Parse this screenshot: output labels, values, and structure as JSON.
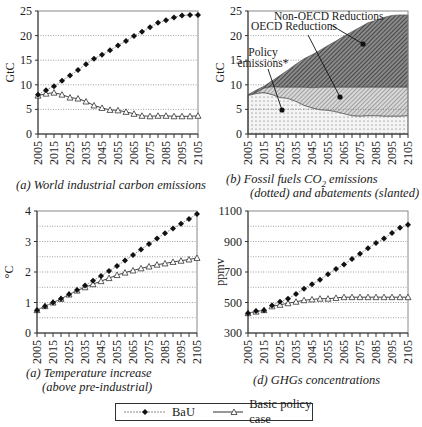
{
  "years": [
    "2005",
    "2015",
    "2025",
    "2035",
    "2045",
    "2055",
    "2065",
    "2075",
    "2085",
    "2095",
    "2105"
  ],
  "legend": {
    "bau_label": "BaU",
    "policy_label": "Basic policy case"
  },
  "panels": {
    "a": {
      "caption": "(a) World industrial carbon emissions",
      "ylabel": "GtC",
      "yticks": [
        "0",
        "5",
        "10",
        "15",
        "20",
        "25"
      ]
    },
    "b": {
      "caption_line1_prefix": "(b)  Fossil fuels CO",
      "caption_line1_sub": "2",
      "caption_line1_suffix": " emissions",
      "caption_line2": "(dotted) and abatements (slanted)",
      "ylabel": "GtC",
      "yticks": [
        "0",
        "5",
        "10",
        "15",
        "20",
        "25"
      ],
      "annotations": {
        "non_oecd": "Non-OECD Reductions",
        "oecd": "OECD Reductions",
        "policy_line1": "Policy",
        "policy_line2": "emissions*"
      }
    },
    "c": {
      "caption_line1": "(a)  Temperature increase",
      "caption_line2": "(above pre-industrial)",
      "ylabel": "°C",
      "yticks": [
        "0",
        "1",
        "2",
        "3",
        "4"
      ]
    },
    "d": {
      "caption": "(d) GHGs concentrations",
      "ylabel": "ppmv",
      "yticks": [
        "300",
        "500",
        "700",
        "900",
        "1100"
      ]
    }
  },
  "chart_data": [
    {
      "type": "line",
      "title": "(a) World industrial carbon emissions",
      "xlabel": "",
      "ylabel": "GtC",
      "ylim": [
        0,
        25
      ],
      "grid": "horizontal dotted every 5",
      "x": [
        2005,
        2010,
        2015,
        2020,
        2025,
        2030,
        2035,
        2040,
        2045,
        2050,
        2055,
        2060,
        2065,
        2070,
        2075,
        2080,
        2085,
        2090,
        2095,
        2100,
        2105
      ],
      "series": [
        {
          "name": "BaU",
          "marker": "filled-diamond",
          "values": [
            8.0,
            8.9,
            9.7,
            10.8,
            11.9,
            13.0,
            14.2,
            15.3,
            16.1,
            17.0,
            18.0,
            18.9,
            19.9,
            20.8,
            21.7,
            22.6,
            23.1,
            23.7,
            24.1,
            24.2,
            24.2
          ]
        },
        {
          "name": "Basic policy case",
          "marker": "open-triangle",
          "values": [
            7.8,
            8.2,
            8.4,
            8.0,
            7.4,
            7.2,
            6.6,
            5.8,
            5.3,
            4.9,
            4.8,
            4.5,
            4.1,
            3.7,
            3.6,
            3.7,
            3.7,
            3.6,
            3.6,
            3.6,
            3.7
          ]
        }
      ]
    },
    {
      "type": "area",
      "title": "(b) Fossil fuels CO2 emissions (dotted) and abatements (slanted)",
      "xlabel": "",
      "ylabel": "GtC",
      "ylim": [
        0,
        25
      ],
      "grid": "horizontal dotted every 5",
      "x": [
        2005,
        2010,
        2015,
        2020,
        2025,
        2030,
        2035,
        2040,
        2045,
        2050,
        2055,
        2060,
        2065,
        2070,
        2075,
        2080,
        2085,
        2090,
        2095,
        2100,
        2105
      ],
      "series": [
        {
          "name": "Policy emissions*",
          "pattern": "dotted",
          "values": [
            7.8,
            8.2,
            8.4,
            8.0,
            7.4,
            7.2,
            6.6,
            5.8,
            5.3,
            4.9,
            4.8,
            4.5,
            4.1,
            3.7,
            3.6,
            3.7,
            3.7,
            3.6,
            3.6,
            3.6,
            3.7
          ]
        },
        {
          "name": "OECD Reductions (top boundary)",
          "pattern": "light-slanted",
          "values": [
            7.8,
            8.4,
            9.3,
            9.6,
            9.5,
            9.5,
            9.5,
            9.5,
            9.4,
            9.5,
            9.5,
            9.5,
            9.5,
            9.5,
            9.5,
            9.5,
            9.5,
            9.5,
            9.5,
            9.5,
            9.5
          ]
        },
        {
          "name": "Non-OECD Reductions (top boundary = BaU)",
          "pattern": "dark-slanted",
          "values": [
            8.0,
            8.9,
            9.7,
            10.8,
            11.9,
            13.0,
            14.2,
            15.3,
            16.1,
            17.0,
            18.0,
            18.9,
            19.9,
            20.8,
            21.7,
            22.6,
            23.1,
            23.7,
            24.1,
            24.2,
            24.2
          ]
        }
      ],
      "annotations": [
        "Non-OECD Reductions",
        "OECD Reductions",
        "Policy emissions*"
      ]
    },
    {
      "type": "line",
      "title": "(a) Temperature increase (above pre-industrial)",
      "xlabel": "",
      "ylabel": "°C",
      "ylim": [
        0,
        4
      ],
      "grid": "horizontal dotted every 0.5",
      "x": [
        2005,
        2010,
        2015,
        2020,
        2025,
        2030,
        2035,
        2040,
        2045,
        2050,
        2055,
        2060,
        2065,
        2070,
        2075,
        2080,
        2085,
        2090,
        2095,
        2100,
        2105
      ],
      "series": [
        {
          "name": "BaU",
          "marker": "filled-diamond",
          "values": [
            0.75,
            0.88,
            1.0,
            1.12,
            1.27,
            1.41,
            1.56,
            1.71,
            1.87,
            2.03,
            2.2,
            2.38,
            2.56,
            2.74,
            2.92,
            3.1,
            3.27,
            3.43,
            3.58,
            3.74,
            3.9
          ]
        },
        {
          "name": "Basic policy case",
          "marker": "open-triangle",
          "values": [
            0.75,
            0.88,
            1.0,
            1.12,
            1.26,
            1.39,
            1.5,
            1.6,
            1.7,
            1.8,
            1.9,
            1.98,
            2.05,
            2.12,
            2.18,
            2.24,
            2.28,
            2.33,
            2.37,
            2.41,
            2.46
          ]
        }
      ]
    },
    {
      "type": "line",
      "title": "(d) GHGs concentrations",
      "xlabel": "",
      "ylabel": "ppmv",
      "ylim": [
        300,
        1100
      ],
      "grid": "horizontal dotted every 100",
      "x": [
        2005,
        2010,
        2015,
        2020,
        2025,
        2030,
        2035,
        2040,
        2045,
        2050,
        2055,
        2060,
        2065,
        2070,
        2075,
        2080,
        2085,
        2090,
        2095,
        2100,
        2105
      ],
      "series": [
        {
          "name": "BaU",
          "marker": "filled-diamond",
          "values": [
            430,
            445,
            450,
            480,
            505,
            525,
            555,
            590,
            620,
            650,
            685,
            720,
            750,
            785,
            820,
            855,
            890,
            920,
            955,
            990,
            1010
          ]
        },
        {
          "name": "Basic policy case",
          "marker": "open-triangle",
          "values": [
            430,
            440,
            450,
            475,
            485,
            495,
            505,
            515,
            520,
            525,
            525,
            530,
            535,
            535,
            535,
            535,
            535,
            535,
            535,
            535,
            535
          ]
        }
      ]
    }
  ]
}
